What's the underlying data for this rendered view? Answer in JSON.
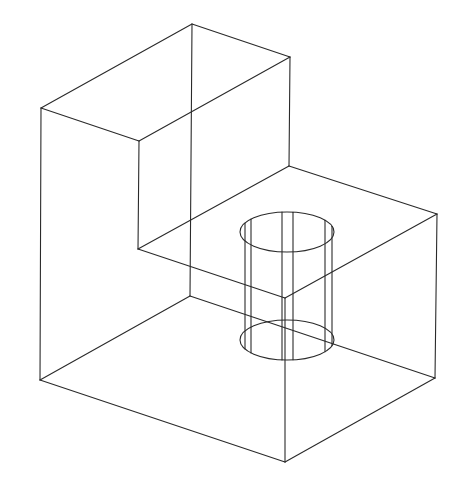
{
  "diagram": {
    "type": "isometric-wireframe",
    "stroke_color": "#2a2a2a",
    "background": "#ffffff",
    "vertices": {
      "top_back": [
        192,
        24
      ],
      "top_right": [
        290,
        57
      ],
      "top_left_front": [
        41,
        108
      ],
      "inner_front_top": [
        139,
        141
      ],
      "step_back": [
        289,
        166
      ],
      "step_right": [
        437,
        214
      ],
      "inner_corner": [
        138,
        249
      ],
      "step_front": [
        285,
        298
      ],
      "hidden_back_bottom": [
        190,
        296
      ],
      "bottom_left": [
        40,
        380
      ],
      "bottom_right": [
        435,
        378
      ],
      "bottom_front": [
        285,
        462
      ]
    },
    "edges": [
      [
        "top_left_front",
        "top_back"
      ],
      [
        "top_back",
        "top_right"
      ],
      [
        "top_left_front",
        "inner_front_top"
      ],
      [
        "inner_front_top",
        "top_right"
      ],
      [
        "top_back",
        "hidden_back_bottom"
      ],
      [
        "top_right",
        "step_back"
      ],
      [
        "top_left_front",
        "bottom_left"
      ],
      [
        "inner_front_top",
        "inner_corner"
      ],
      [
        "inner_corner",
        "step_back"
      ],
      [
        "step_back",
        "step_right"
      ],
      [
        "inner_corner",
        "step_front"
      ],
      [
        "step_front",
        "step_right"
      ],
      [
        "step_right",
        "bottom_right"
      ],
      [
        "step_front",
        "bottom_front"
      ],
      [
        "bottom_left",
        "bottom_front"
      ],
      [
        "bottom_front",
        "bottom_right"
      ],
      [
        "bottom_left",
        "hidden_back_bottom"
      ],
      [
        "hidden_back_bottom",
        "bottom_right"
      ]
    ],
    "cylinder": {
      "top_ellipse": {
        "cx": 287,
        "cy": 232,
        "rx": 47,
        "ry": 20
      },
      "bottom_ellipse": {
        "cx": 287,
        "cy": 340,
        "rx": 47,
        "ry": 20
      },
      "vertical_lines_x": [
        245,
        251,
        282,
        293,
        325,
        332
      ]
    }
  }
}
